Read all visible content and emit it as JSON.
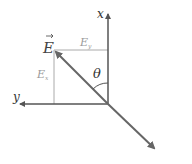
{
  "diagram": {
    "axes": {
      "x_label": "x",
      "y_label": "y"
    },
    "vector": {
      "label": "E",
      "has_arrow_accent": true
    },
    "components": {
      "ex_label": "E",
      "ex_subscript": "x",
      "ey_label": "E",
      "ey_subscript": "y"
    },
    "angle_label": "θ",
    "colors": {
      "axis": "#555555",
      "vector": "#666666",
      "component_lines": "#aaaaaa",
      "component_text": "#999999",
      "text": "#333333"
    }
  }
}
